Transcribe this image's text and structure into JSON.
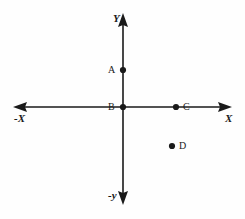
{
  "figure": {
    "type": "coordinate-plane-diagram",
    "background_color": "#fefefe",
    "stroke_color": "#1a1a1a",
    "axes": {
      "y_positive_label": "Y",
      "y_negative_label": "-y",
      "x_positive_label": "X",
      "x_negative_label": "-X"
    },
    "points": [
      {
        "id": "A",
        "label": "A",
        "x": 123,
        "y": 70,
        "label_side": "left"
      },
      {
        "id": "B",
        "label": "B",
        "x": 123,
        "y": 107,
        "label_side": "left"
      },
      {
        "id": "C",
        "label": "C",
        "x": 176,
        "y": 107,
        "label_side": "right"
      },
      {
        "id": "D",
        "label": "D",
        "x": 172,
        "y": 146,
        "label_side": "right"
      }
    ],
    "origin": {
      "x": 123,
      "y": 107
    },
    "extents": {
      "x_min": 13,
      "x_max": 232,
      "y_min": 13,
      "y_max": 205
    }
  }
}
